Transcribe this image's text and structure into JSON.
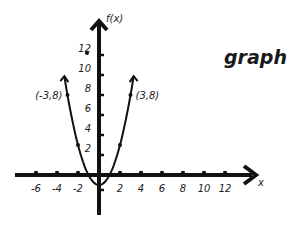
{
  "chart_data": {
    "type": "line",
    "title": "graph",
    "xlabel": "x",
    "ylabel": "f(x)",
    "function": "f(x) = x^2 - 1",
    "x_ticks": [
      -6,
      -4,
      -2,
      2,
      4,
      6,
      8,
      10,
      12
    ],
    "y_ticks": [
      2,
      4,
      6,
      8,
      10,
      12
    ],
    "xlim": [
      -8,
      14
    ],
    "ylim": [
      -4,
      14
    ],
    "grid": false,
    "legend": null,
    "series": [
      {
        "name": "f(x)",
        "points": [
          {
            "x": -3,
            "y": 8,
            "label": "(-3,8)"
          },
          {
            "x": -2,
            "y": 3
          },
          {
            "x": 2,
            "y": 3
          },
          {
            "x": 3,
            "y": 8,
            "label": "(3,8)"
          }
        ],
        "vertex": {
          "x": 0,
          "y": -1
        }
      }
    ],
    "annotations": [
      {
        "text": "(-3,8)",
        "x": -3,
        "y": 8
      },
      {
        "text": "(3,8)",
        "x": 3,
        "y": 8
      },
      {
        "type": "dot",
        "x": -0.6,
        "y": 12
      }
    ]
  },
  "colors": {
    "ink": "#111111",
    "background": "#ffffff"
  }
}
